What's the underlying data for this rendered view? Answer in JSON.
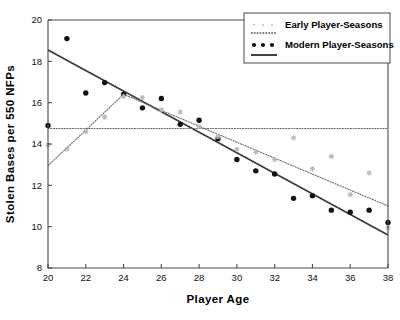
{
  "chart_data": {
    "type": "scatter",
    "title": "",
    "xlabel": "Player Age",
    "ylabel": "Stolen Bases per 550 NFPs",
    "xlim": [
      20,
      38
    ],
    "ylim": [
      8,
      20
    ],
    "xticks": [
      20,
      22,
      24,
      26,
      28,
      30,
      32,
      34,
      36,
      38
    ],
    "yticks": [
      8,
      10,
      12,
      14,
      16,
      18,
      20
    ],
    "grid": false,
    "legend_position": "top-right",
    "legend": [
      {
        "label": "Early Player-Seasons",
        "marker": "light-dot",
        "color": "#b9b9b9"
      },
      {
        "label": "",
        "marker": "dotted-line",
        "color": "#6f6f6f"
      },
      {
        "label": "Modern Player-Seasons",
        "marker": "dark-dot",
        "color": "#111111"
      },
      {
        "label": "",
        "marker": "solid-line",
        "color": "#3a3a3a"
      }
    ],
    "series": [
      {
        "name": "Modern Player-Seasons",
        "marker": "filled-circle",
        "color": "#111111",
        "x": [
          20,
          21,
          22,
          23,
          24,
          25,
          26,
          27,
          28,
          29,
          30,
          31,
          32,
          33,
          34,
          35,
          36,
          37,
          38
        ],
        "y": [
          14.9,
          19.1,
          16.47,
          16.97,
          16.4,
          15.75,
          16.2,
          14.95,
          15.15,
          14.25,
          13.25,
          12.7,
          12.55,
          11.37,
          11.5,
          10.8,
          10.7,
          10.8,
          10.2
        ]
      },
      {
        "name": "Early Player-Seasons",
        "marker": "open-star",
        "color": "#b9b9b9",
        "x": [
          20,
          21,
          22,
          23,
          24,
          25,
          26,
          27,
          28,
          29,
          30,
          31,
          32,
          33,
          34,
          35,
          36,
          37,
          38
        ],
        "y": [
          13.95,
          13.75,
          14.6,
          15.3,
          16.3,
          16.25,
          15.65,
          15.55,
          14.85,
          14.35,
          13.75,
          13.6,
          13.25,
          14.3,
          12.8,
          13.4,
          11.55,
          12.6,
          9.95
        ]
      }
    ],
    "fit_lines": [
      {
        "name": "Modern fit",
        "style": "solid",
        "color": "#3a3a3a",
        "x": [
          20,
          38
        ],
        "y": [
          18.55,
          9.6
        ]
      },
      {
        "name": "Early fit segment rising",
        "style": "dotted",
        "color": "#6f6f6f",
        "x": [
          20,
          24
        ],
        "y": [
          12.95,
          16.4
        ]
      },
      {
        "name": "Early fit segment declining",
        "style": "dotted",
        "color": "#6f6f6f",
        "x": [
          24,
          38
        ],
        "y": [
          16.4,
          11.0
        ]
      },
      {
        "name": "Early horizontal reference",
        "style": "dotted",
        "color": "#6f6f6f",
        "x": [
          20,
          38
        ],
        "y": [
          14.75,
          14.75
        ]
      }
    ]
  }
}
